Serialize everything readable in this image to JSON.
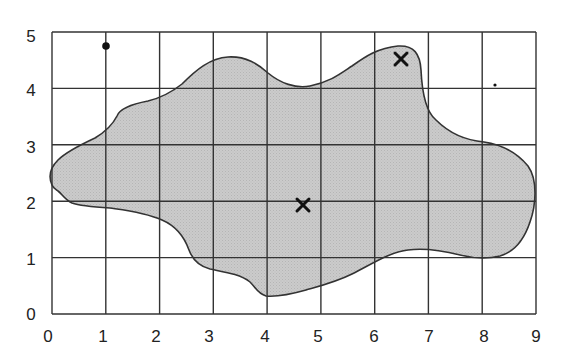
{
  "figure": {
    "grid": {
      "x_min": 0,
      "x_max": 9,
      "y_min": 0,
      "y_max": 5,
      "x_ticks": [
        "0",
        "1",
        "2",
        "3",
        "4",
        "5",
        "6",
        "7",
        "8",
        "9"
      ],
      "y_ticks": [
        "0",
        "1",
        "2",
        "3",
        "4",
        "5"
      ]
    },
    "colors": {
      "grid_line": "#333333",
      "region_fill": "#c8c8c8",
      "region_stroke": "#333333",
      "marker": "#111111",
      "background": "#ffffff"
    },
    "markers": [
      {
        "type": "x",
        "x": 6.5,
        "y": 4.5
      },
      {
        "type": "x",
        "x": 4.7,
        "y": 1.95
      },
      {
        "type": "dot-large",
        "x": 1.0,
        "y": 4.75
      },
      {
        "type": "dot-small",
        "x": 8.25,
        "y": 4.07
      }
    ]
  }
}
